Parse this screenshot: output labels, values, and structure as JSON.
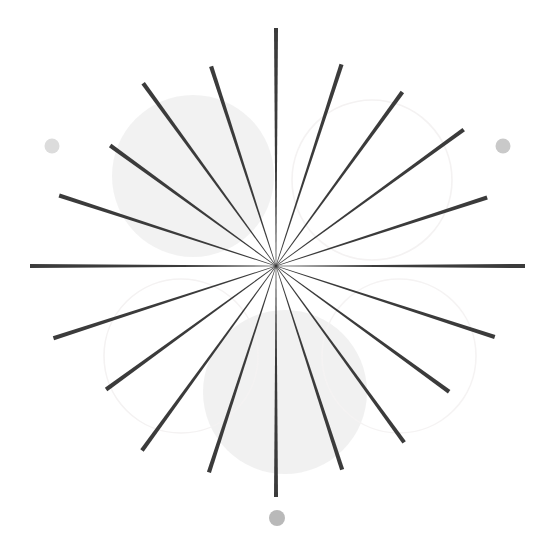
{
  "canvas": {
    "width": 553,
    "height": 544,
    "background_color": "#ffffff",
    "title": "Radial burst figure"
  },
  "chart_data": {
    "type": "scatter",
    "xlabel": "",
    "ylabel": "",
    "xlim": [
      0,
      553
    ],
    "ylim": [
      0,
      544
    ],
    "grid": false,
    "legend": null,
    "center": {
      "x": 276,
      "y": 266
    },
    "ray_count": 20,
    "angle_step_deg": 18,
    "ray_color": "#3b3b3b",
    "ray_inner_width": 0.6,
    "ray_outer_width": 4.2,
    "ray_inner_radius": 0,
    "series": [
      {
        "name": "ray-00",
        "angle_deg": 0,
        "length": 249,
        "outer_width": 4.0,
        "x2": 525,
        "y2": 266
      },
      {
        "name": "ray-01",
        "angle_deg": 18,
        "length": 222,
        "outer_width": 4.2,
        "x2": 487,
        "y2": 197
      },
      {
        "name": "ray-02",
        "angle_deg": 36,
        "length": 232,
        "outer_width": 4.2,
        "x2": 464,
        "y2": 130
      },
      {
        "name": "ray-03",
        "angle_deg": 54,
        "length": 215,
        "outer_width": 4.2,
        "x2": 402,
        "y2": 92
      },
      {
        "name": "ray-04",
        "angle_deg": 72,
        "length": 212,
        "outer_width": 4.2,
        "x2": 341,
        "y2": 64
      },
      {
        "name": "ray-05",
        "angle_deg": 90,
        "length": 238,
        "outer_width": 4.0,
        "x2": 277,
        "y2": 28
      },
      {
        "name": "ray-06",
        "angle_deg": 108,
        "length": 210,
        "outer_width": 4.2,
        "x2": 211,
        "y2": 66
      },
      {
        "name": "ray-07",
        "angle_deg": 126,
        "length": 226,
        "outer_width": 4.2,
        "x2": 143,
        "y2": 73
      },
      {
        "name": "ray-08",
        "angle_deg": 144,
        "length": 205,
        "outer_width": 4.2,
        "x2": 110,
        "y2": 145
      },
      {
        "name": "ray-09",
        "angle_deg": 162,
        "length": 228,
        "outer_width": 4.2,
        "x2": 59,
        "y2": 194
      },
      {
        "name": "ray-10",
        "angle_deg": 180,
        "length": 246,
        "outer_width": 4.0,
        "x2": 30,
        "y2": 266
      },
      {
        "name": "ray-11",
        "angle_deg": 198,
        "length": 234,
        "outer_width": 4.2,
        "x2": 53,
        "y2": 338
      },
      {
        "name": "ray-12",
        "angle_deg": 216,
        "length": 210,
        "outer_width": 4.2,
        "x2": 106,
        "y2": 389
      },
      {
        "name": "ray-13",
        "angle_deg": 234,
        "length": 228,
        "outer_width": 4.2,
        "x2": 142,
        "y2": 450
      },
      {
        "name": "ray-14",
        "angle_deg": 252,
        "length": 217,
        "outer_width": 4.2,
        "x2": 209,
        "y2": 473
      },
      {
        "name": "ray-15",
        "angle_deg": 270,
        "length": 231,
        "outer_width": 4.0,
        "x2": 277,
        "y2": 497
      },
      {
        "name": "ray-16",
        "angle_deg": 288,
        "length": 214,
        "outer_width": 4.2,
        "x2": 343,
        "y2": 469
      },
      {
        "name": "ray-17",
        "angle_deg": 306,
        "length": 218,
        "outer_width": 4.2,
        "x2": 404,
        "y2": 442
      },
      {
        "name": "ray-18",
        "angle_deg": 324,
        "length": 214,
        "outer_width": 4.2,
        "x2": 449,
        "y2": 392
      },
      {
        "name": "ray-19",
        "angle_deg": 342,
        "length": 230,
        "outer_width": 4.2,
        "x2": 495,
        "y2": 330
      }
    ],
    "background_shapes": [
      {
        "name": "blob-upper-left",
        "kind": "filled-circle",
        "cx": 193,
        "cy": 176,
        "r": 81,
        "fill": "#f0f0f0",
        "opacity": 0.85
      },
      {
        "name": "blob-bottom",
        "kind": "filled-circle",
        "cx": 285,
        "cy": 392,
        "r": 82,
        "fill": "#efefef",
        "opacity": 0.9
      },
      {
        "name": "ring-upper-right",
        "kind": "outline-circle",
        "cx": 372,
        "cy": 180,
        "r": 80,
        "stroke": "#f4f2f2",
        "stroke_width": 1.6
      },
      {
        "name": "ring-lower-left",
        "kind": "outline-circle",
        "cx": 181,
        "cy": 356,
        "r": 77,
        "stroke": "#f4f2f2",
        "stroke_width": 1.6
      },
      {
        "name": "ring-lower-right",
        "kind": "outline-circle",
        "cx": 399,
        "cy": 356,
        "r": 77,
        "stroke": "#f5f3f3",
        "stroke_width": 1.6
      }
    ],
    "dots": [
      {
        "name": "dot-left",
        "cx": 52,
        "cy": 146,
        "r": 7.5,
        "fill": "#dcdcdc"
      },
      {
        "name": "dot-right",
        "cx": 503,
        "cy": 146,
        "r": 7.5,
        "fill": "#c9c9c9"
      },
      {
        "name": "dot-bottom",
        "cx": 277,
        "cy": 518,
        "r": 8.0,
        "fill": "#b9b9b9"
      }
    ]
  }
}
